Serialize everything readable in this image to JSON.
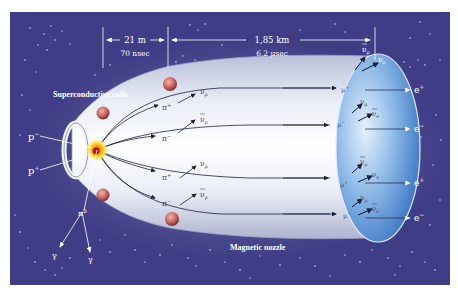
{
  "diagram": {
    "background_color": "#3e3d86",
    "border_color": "#ffffff",
    "beam_color": "#e8ecf4",
    "disk_color": "#5a8fd6",
    "distances": {
      "first": {
        "length": "21 m",
        "time": "70 nsec"
      },
      "second": {
        "length": "1,85 km",
        "time": "6,2 µsec"
      }
    },
    "labels": {
      "coils": "Superconductive coils",
      "nozzle": "Magnetic nozzle",
      "proton_minus": "p",
      "proton_minus_sup": "−",
      "proton_plus": "p",
      "proton_plus_sup": "+",
      "pi_zero": "π",
      "pi_zero_sup": "0",
      "gamma": "γ"
    },
    "pions": [
      {
        "label": "π",
        "sup": "+"
      },
      {
        "label": "π",
        "sup": "−"
      },
      {
        "label": "π",
        "sup": "+"
      },
      {
        "label": "π",
        "sup": "−"
      }
    ],
    "pion_neutrinos": [
      {
        "label": "ν",
        "sub": "μ",
        "bar": false
      },
      {
        "label": "ν",
        "sub": "μ",
        "bar": true
      },
      {
        "label": "ν",
        "sub": "μ",
        "bar": false
      },
      {
        "label": "ν",
        "sub": "μ",
        "bar": true
      }
    ],
    "muons": [
      {
        "label": "μ",
        "sup": "+"
      },
      {
        "label": "μ",
        "sup": "−"
      },
      {
        "label": "μ",
        "sup": "+"
      },
      {
        "label": "μ",
        "sup": "−"
      }
    ],
    "muon_neutrinos": [
      {
        "nu_mu": "ν",
        "nu_mu_sub": "μ",
        "nu_mu_bar": true,
        "nu_e": "ν",
        "nu_e_sub": "e",
        "nu_e_bar": false
      },
      {
        "nu_mu": "ν",
        "nu_mu_sub": "μ",
        "nu_mu_bar": false,
        "nu_e": "ν",
        "nu_e_sub": "e",
        "nu_e_bar": true
      },
      {
        "nu_mu": "ν",
        "nu_mu_sub": "μ",
        "nu_mu_bar": true,
        "nu_e": "ν",
        "nu_e_sub": "e",
        "nu_e_bar": false
      },
      {
        "nu_mu": "ν",
        "nu_mu_sub": "μ",
        "nu_mu_bar": false,
        "nu_e": "ν",
        "nu_e_sub": "e",
        "nu_e_bar": true
      }
    ],
    "electrons": [
      {
        "label": "e",
        "sup": "+"
      },
      {
        "label": "e",
        "sup": "−"
      },
      {
        "label": "e",
        "sup": "+"
      },
      {
        "label": "e",
        "sup": "−"
      }
    ]
  }
}
